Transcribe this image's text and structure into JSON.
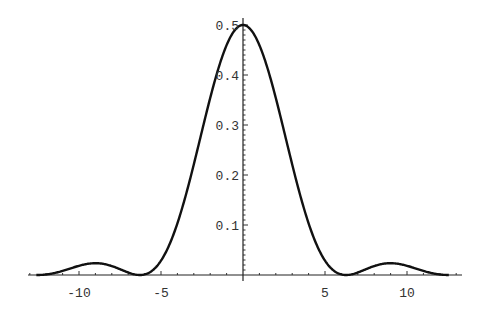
{
  "chart_data": {
    "type": "line",
    "title": "",
    "xlabel": "",
    "ylabel": "",
    "xlim": [
      -13,
      13
    ],
    "ylim": [
      0,
      0.5
    ],
    "grid": false,
    "function": "0.5 * (sin(x/2)/(x/2))^2",
    "x_ticks": [
      {
        "value": -10,
        "label": "-10"
      },
      {
        "value": -5,
        "label": "-5"
      },
      {
        "value": 5,
        "label": "5"
      },
      {
        "value": 10,
        "label": "10"
      }
    ],
    "y_ticks": [
      {
        "value": 0.1,
        "label": "0.1"
      },
      {
        "value": 0.2,
        "label": "0.2"
      },
      {
        "value": 0.3,
        "label": "0.3"
      },
      {
        "value": 0.4,
        "label": "0.4"
      },
      {
        "value": 0.5,
        "label": "0.5"
      }
    ],
    "series": [
      {
        "name": "curve",
        "x": [
          -12.5,
          -11,
          -10,
          -9,
          -8,
          -7,
          -6.28,
          -5,
          -4,
          -3,
          -2,
          -1,
          0,
          1,
          2,
          3,
          4,
          5,
          6.28,
          7,
          8,
          9,
          10,
          11,
          12.5
        ],
        "y": [
          0.001,
          0.012,
          0.018,
          0.021,
          0.015,
          0.005,
          0.0,
          0.037,
          0.103,
          0.198,
          0.354,
          0.46,
          0.5,
          0.46,
          0.354,
          0.198,
          0.103,
          0.037,
          0.0,
          0.005,
          0.015,
          0.021,
          0.018,
          0.012,
          0.001
        ]
      }
    ]
  }
}
